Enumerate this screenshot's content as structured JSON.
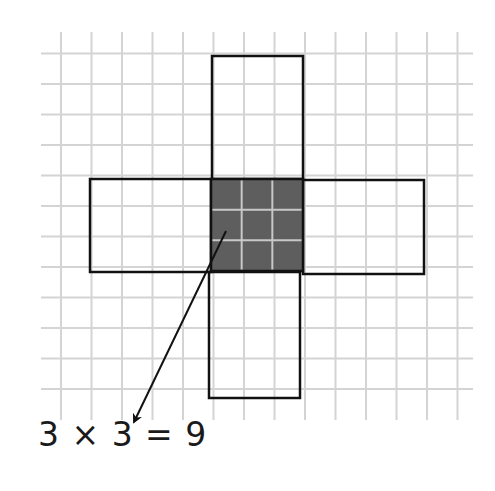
{
  "diagram": {
    "type": "area-by-squares",
    "grid": {
      "color": "#d4d4d4",
      "cell_size": 30.5,
      "vertical_lines_x_start": 61,
      "vertical_line_count": 14,
      "horizontal_lines_y_start": 53.5,
      "horizontal_line_count": 12,
      "x_extent": [
        41,
        473
      ],
      "y_extent": [
        32,
        420
      ]
    },
    "cross": {
      "stroke": "#111111",
      "center_square": {
        "x": 211,
        "y": 179,
        "size": 92,
        "fill": "#5e5e5e",
        "rows": 3,
        "cols": 3,
        "inner_grid_color": "#c8c8c8"
      },
      "top_arm": {
        "x": 212,
        "y": 56,
        "width": 91,
        "height": 123
      },
      "bottom_arm": {
        "x": 209,
        "y": 272,
        "width": 91,
        "height": 126
      },
      "left_arm": {
        "x": 90,
        "y": 179,
        "width": 121,
        "height": 93
      },
      "right_arm": {
        "x": 303,
        "y": 180,
        "width": 121,
        "height": 94
      }
    },
    "arrow": {
      "from": [
        226,
        231
      ],
      "to": [
        134,
        422
      ],
      "color": "#111111"
    },
    "equation": {
      "text": "3 × 3 = 9",
      "left_operand": "3",
      "operator": "×",
      "right_operand": "3",
      "equals": "=",
      "result": "9"
    }
  }
}
